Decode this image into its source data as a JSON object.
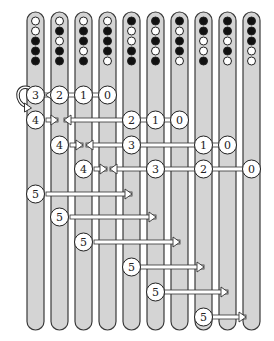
{
  "diagram": {
    "colors": {
      "bar_fill": "#d4d4d4",
      "bar_stroke": "#3a3a3a",
      "bead_black": "#111111",
      "bead_white": "#ffffff",
      "circle_fill": "#ffffff",
      "arrow_fill": "#ffffff",
      "arrow_stroke": "#333333"
    },
    "columns": [
      {
        "index": 1,
        "beads": [
          "W",
          "W",
          "B",
          "B",
          "B"
        ]
      },
      {
        "index": 2,
        "beads": [
          "W",
          "B",
          "W",
          "B",
          "B"
        ]
      },
      {
        "index": 3,
        "beads": [
          "W",
          "B",
          "B",
          "W",
          "B"
        ]
      },
      {
        "index": 4,
        "beads": [
          "W",
          "B",
          "B",
          "B",
          "W"
        ]
      },
      {
        "index": 5,
        "beads": [
          "B",
          "W",
          "W",
          "B",
          "B"
        ]
      },
      {
        "index": 6,
        "beads": [
          "B",
          "W",
          "B",
          "W",
          "B"
        ]
      },
      {
        "index": 7,
        "beads": [
          "B",
          "W",
          "B",
          "B",
          "W"
        ]
      },
      {
        "index": 8,
        "beads": [
          "B",
          "B",
          "W",
          "W",
          "B"
        ]
      },
      {
        "index": 9,
        "beads": [
          "B",
          "B",
          "W",
          "B",
          "W"
        ]
      },
      {
        "index": 10,
        "beads": [
          "B",
          "B",
          "B",
          "W",
          "W"
        ]
      }
    ],
    "rows": [
      {
        "y": 95,
        "circles": [
          {
            "col": 1,
            "label": "3"
          },
          {
            "col": 2,
            "label": "2"
          },
          {
            "col": 3,
            "label": "1"
          },
          {
            "col": 4,
            "label": "0"
          }
        ],
        "loop_arrow": true
      },
      {
        "y": 120,
        "circles": [
          {
            "col": 1,
            "label": "4"
          },
          {
            "col": 5,
            "label": "2"
          },
          {
            "col": 6,
            "label": "1"
          },
          {
            "col": 7,
            "label": "0"
          }
        ],
        "arrows": [
          {
            "from_x": 46,
            "to_x": 58,
            "dir": "right"
          },
          {
            "from_x": 120,
            "to_x": 64,
            "dir": "left"
          }
        ]
      },
      {
        "y": 145,
        "circles": [
          {
            "col": 2,
            "label": "4"
          },
          {
            "col": 5,
            "label": "3"
          },
          {
            "col": 8,
            "label": "1"
          },
          {
            "col": 9,
            "label": "0"
          }
        ],
        "arrows": [
          {
            "from_x": 70,
            "to_x": 83,
            "dir": "right"
          },
          {
            "from_x": 120,
            "to_x": 86,
            "dir": "left"
          }
        ]
      },
      {
        "y": 169,
        "circles": [
          {
            "col": 3,
            "label": "4"
          },
          {
            "col": 6,
            "label": "3"
          },
          {
            "col": 8,
            "label": "2"
          },
          {
            "col": 10,
            "label": "0"
          }
        ],
        "arrows": [
          {
            "from_x": 94,
            "to_x": 107,
            "dir": "right"
          },
          {
            "from_x": 144,
            "to_x": 110,
            "dir": "left"
          }
        ]
      },
      {
        "y": 194,
        "circles": [
          {
            "col": 1,
            "label": "5"
          }
        ],
        "arrows": [
          {
            "from_x": 46,
            "to_x": 132,
            "dir": "right"
          }
        ]
      },
      {
        "y": 217,
        "circles": [
          {
            "col": 2,
            "label": "5"
          }
        ],
        "arrows": [
          {
            "from_x": 70,
            "to_x": 156,
            "dir": "right"
          }
        ]
      },
      {
        "y": 242,
        "circles": [
          {
            "col": 3,
            "label": "5"
          }
        ],
        "arrows": [
          {
            "from_x": 94,
            "to_x": 180,
            "dir": "right"
          }
        ]
      },
      {
        "y": 267,
        "circles": [
          {
            "col": 5,
            "label": "5"
          }
        ],
        "arrows": [
          {
            "from_x": 140,
            "to_x": 204,
            "dir": "right"
          }
        ]
      },
      {
        "y": 292,
        "circles": [
          {
            "col": 6,
            "label": "5"
          }
        ],
        "arrows": [
          {
            "from_x": 164,
            "to_x": 228,
            "dir": "right"
          }
        ]
      },
      {
        "y": 317,
        "circles": [
          {
            "col": 8,
            "label": "5"
          }
        ],
        "arrows": [
          {
            "from_x": 212,
            "to_x": 246,
            "dir": "right"
          }
        ]
      }
    ]
  }
}
